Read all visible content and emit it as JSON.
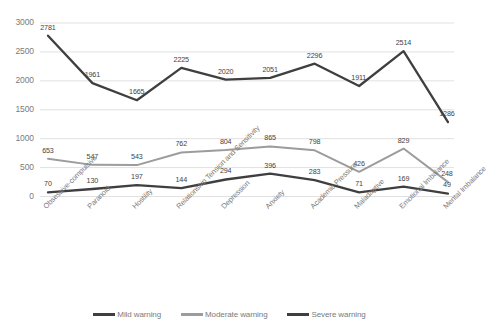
{
  "chart_data": {
    "type": "line",
    "title": "",
    "subtitle": "",
    "xlabel": "",
    "ylabel": "",
    "ylim": [
      0,
      3000
    ],
    "yticks": [
      "0",
      "500",
      "1000",
      "1500",
      "2000",
      "2500",
      "3000"
    ],
    "grid": true,
    "legend_position": "bottom",
    "categories": [
      "Obsessive-compulsive",
      "Paranoid",
      "Hostility",
      "Relationship Tension and Sensitivity",
      "Depression",
      "Anxiety",
      "Academic Pressure",
      "Maladaptive",
      "Emotional Imbalance",
      "Mental Imbalance"
    ],
    "series": [
      {
        "name": "Mild warning",
        "color": "#3f3f3f",
        "values": [
          70,
          130,
          197,
          144,
          294,
          396,
          283,
          71,
          169,
          49
        ]
      },
      {
        "name": "Moderate warning",
        "color": "#9c9c9c",
        "values": [
          653,
          547,
          543,
          762,
          804,
          865,
          798,
          426,
          829,
          248
        ]
      },
      {
        "name": "Severe warning",
        "color": "#3f3f3f",
        "values": [
          2781,
          1961,
          1665,
          2225,
          2020,
          2051,
          2296,
          1911,
          2514,
          1286
        ]
      }
    ]
  },
  "legend": {
    "items": [
      {
        "label": "Mild warning",
        "color": "#3f3f3f"
      },
      {
        "label": "Moderate warning",
        "color": "#9c9c9c"
      },
      {
        "label": "Severe warning",
        "color": "#3f3f3f"
      }
    ]
  }
}
